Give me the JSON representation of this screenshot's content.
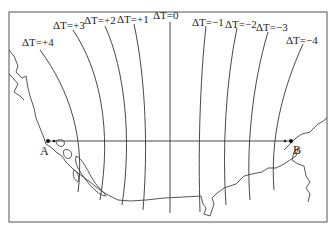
{
  "figure": {
    "isolines": [
      {
        "value": "+4",
        "label": "ΔT=+4"
      },
      {
        "value": "+3",
        "label": "ΔT=+3"
      },
      {
        "value": "+2",
        "label": "ΔT=+2"
      },
      {
        "value": "+1",
        "label": "ΔT=+1"
      },
      {
        "value": "0",
        "label": "ΔT=0"
      },
      {
        "value": "-1",
        "label": "ΔT=−1"
      },
      {
        "value": "-2",
        "label": "ΔT=−2"
      },
      {
        "value": "-3",
        "label": "ΔT=−3"
      },
      {
        "value": "-4",
        "label": "ΔT=−4"
      }
    ],
    "points": {
      "a": "A",
      "b": "B"
    },
    "colors": {
      "line": "#333333",
      "frame": "#555555",
      "background": "#ffffff"
    }
  }
}
